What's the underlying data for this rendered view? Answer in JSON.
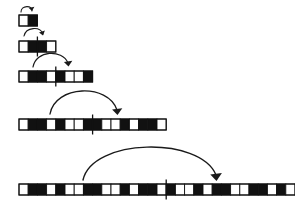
{
  "figure": {
    "canvas": {
      "width": 295,
      "height": 208,
      "background": "#ffffff"
    },
    "colors": {
      "filled_cell": "#111111",
      "empty_cell": "#ffffff",
      "cell_border": "#111111",
      "arrow": "#1a1a1a",
      "tick": "#111111"
    },
    "cell_width": 9.2,
    "cell_height": 11,
    "rows": [
      {
        "index": 1,
        "name": "row-1",
        "label": "length 2",
        "x": 19,
        "y": 15,
        "cell_count": 2,
        "cells": [
          0,
          1
        ],
        "tick": null
      },
      {
        "index": 2,
        "name": "row-2",
        "label": "length 4",
        "x": 19,
        "y": 41,
        "cell_count": 4,
        "cells": [
          0,
          1,
          1,
          0
        ],
        "tick": 2
      },
      {
        "index": 3,
        "name": "row-3",
        "label": "length 8",
        "x": 19,
        "y": 71,
        "cell_count": 8,
        "cells": [
          0,
          1,
          1,
          0,
          1,
          0,
          0,
          1
        ],
        "tick": 4
      },
      {
        "index": 4,
        "name": "row-4",
        "label": "length 16",
        "x": 19,
        "y": 119,
        "cell_count": 16,
        "cells": [
          0,
          1,
          1,
          0,
          1,
          0,
          0,
          1,
          1,
          0,
          0,
          1,
          0,
          1,
          1,
          0
        ],
        "tick": 8
      },
      {
        "index": 5,
        "name": "row-5",
        "label": "length 32",
        "x": 19,
        "y": 184,
        "cell_count": 32,
        "cells": [
          0,
          1,
          1,
          0,
          1,
          0,
          0,
          1,
          1,
          0,
          0,
          1,
          0,
          1,
          1,
          0,
          1,
          0,
          0,
          1,
          0,
          1,
          1,
          0,
          0,
          1,
          1,
          0,
          1,
          0,
          0,
          1
        ],
        "tick": 16
      }
    ],
    "arrows": [
      {
        "name": "arrow-1",
        "from_row": 1,
        "to_row": 1,
        "note": "small loop above the length-2 bar",
        "path": "M 21 12 C 21 5, 33 5, 32 11",
        "head": "M 32 11 l -3.2 -3.0 l 5.6 -1.2 z",
        "width": 1.1
      },
      {
        "name": "arrow-2",
        "from_row": 1,
        "to_row": 2,
        "note": "copies the length-2 block into the right half of the length-4 bar",
        "path": "M 24 36 C 26 27, 40 26, 43 34",
        "head": "M 43 35.5 l -4.0 -2.9 l 5.9 -2.2 z",
        "width": 1.1
      },
      {
        "name": "arrow-3",
        "from_row": 2,
        "to_row": 3,
        "note": "copies the length-4 block into the right half of the length-8 bar",
        "path": "M 33 67 C 36 50, 62 49, 68 63",
        "head": "M 68.5 66.5 l -4.6 -4.4 l 8.4 -1.3 z",
        "width": 1.2
      },
      {
        "name": "arrow-4",
        "from_row": 3,
        "to_row": 4,
        "note": "copies the length-8 block into the right half of the length-16 bar",
        "path": "M 50 114 C 55 85, 108 83, 117 110",
        "head": "M 117.5 115 l -5.4 -5.6 l 10.2 -1.2 z",
        "width": 1.3
      },
      {
        "name": "arrow-5",
        "from_row": 4,
        "to_row": 5,
        "note": "copies the length-16 block into the right half of the length-32 bar",
        "path": "M 83 180 C 92 138, 200 136, 216 175",
        "head": "M 216.5 181 l -6.2 -6.6 l 11.6 -1.4 z",
        "width": 1.4
      }
    ]
  }
}
